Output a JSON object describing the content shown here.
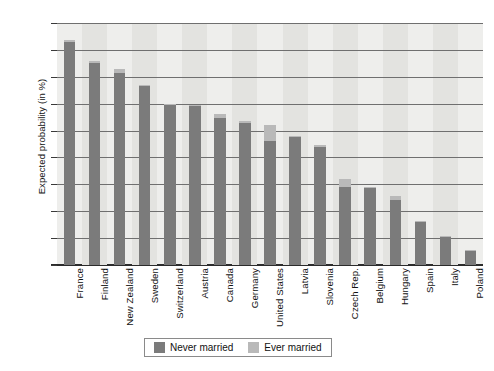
{
  "chart_data": {
    "type": "bar",
    "stacked": true,
    "title": "",
    "xlabel": "",
    "ylabel": "Expected probability (in %)",
    "ylim": [
      0,
      90
    ],
    "ytick_step": 10,
    "yticks": [
      0,
      10,
      20,
      30,
      40,
      50,
      60,
      70,
      80,
      90
    ],
    "grid": "horizontal",
    "legend_position": "bottom-center",
    "categories": [
      "France",
      "Finland",
      "New Zealand",
      "Sweden",
      "Switzerland",
      "Austria",
      "Canada",
      "Germany",
      "United States",
      "Latvia",
      "Slovenia",
      "Czech Rep.",
      "Belgium",
      "Hungary",
      "Spain",
      "Italy",
      "Poland"
    ],
    "series": [
      {
        "name": "Never married",
        "color": "#7b7b7b",
        "values": [
          83,
          75,
          71.5,
          66.5,
          59.5,
          59,
          54.5,
          53,
          46,
          47.5,
          44,
          29,
          28.5,
          24,
          16,
          10.5,
          5.5
        ]
      },
      {
        "name": "Ever married",
        "color": "#b9b9b9",
        "values": [
          0.5,
          1,
          1.5,
          0.5,
          0.5,
          0.5,
          1.5,
          0.5,
          6,
          0.5,
          0.5,
          3,
          0.5,
          1.5,
          0.3,
          0.3,
          0.2
        ]
      }
    ],
    "totals": [
      83.5,
      76,
      73,
      67,
      60,
      59.5,
      56,
      53.5,
      52,
      48,
      44.5,
      32,
      29,
      25.5,
      16.3,
      10.8,
      5.7
    ]
  },
  "legend": {
    "items": [
      {
        "label": "Never married",
        "swatch": "never"
      },
      {
        "label": "Ever married",
        "swatch": "ever"
      }
    ]
  },
  "axes": {
    "y_title": "Expected probability (in %)"
  }
}
